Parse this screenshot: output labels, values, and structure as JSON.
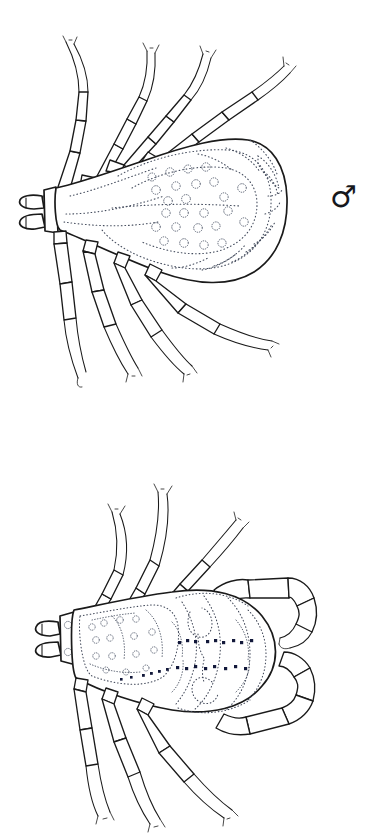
{
  "plate": {
    "background_color": "#ffffff",
    "ink_color": "#1a1a1a",
    "stipple_color": "#3b4250",
    "accent_dot_color": "#12183a",
    "width": 376,
    "height": 839
  },
  "figures": [
    {
      "id": "male",
      "sex": "male",
      "sex_symbol": "♂",
      "symbol_name": "mars-symbol",
      "caption": "",
      "description": "Dorsal view of an adult male hard tick with ornate punctate scutum covering the entire dorsum, four pairs of segmented legs, and a forward-projecting capitulum.",
      "parts": {
        "capitulum": "capitulum",
        "palps": "palps",
        "scutum": "scutum",
        "festoons": "festoons",
        "legs": "legs"
      },
      "leg_count": 8,
      "punctation_count": 22
    },
    {
      "id": "female",
      "sex": "female",
      "sex_symbol": "♀",
      "symbol_name": "venus-symbol",
      "caption": "",
      "description": "Dorsal view of an adult female hard tick with a small ornate scutum, expanded alloscutum, curved posterior legs, and a forward-projecting capitulum.",
      "parts": {
        "capitulum": "capitulum",
        "palps": "palps",
        "scutum": "scutum",
        "alloscutum": "alloscutum",
        "legs": "legs"
      },
      "leg_count": 8,
      "dark_spot_count": 24
    }
  ],
  "symbols": {
    "male": "♂",
    "female": "♀"
  }
}
